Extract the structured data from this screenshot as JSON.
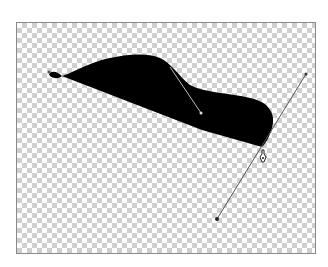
{
  "canvas": {
    "background": "transparent-checkerboard",
    "checker_colors": [
      "#ffffff",
      "#cfcfcf"
    ]
  },
  "shape": {
    "fill": "#000000",
    "anchor_points": [
      [
        49,
        74
      ],
      [
        202,
        114
      ],
      [
        262,
        147
      ]
    ]
  },
  "handles": [
    {
      "from": [
        170,
        67
      ],
      "to": [
        201,
        113
      ]
    },
    {
      "from": [
        306,
        74
      ],
      "to": [
        217,
        219
      ]
    }
  ],
  "cursor": {
    "icon": "pen-tool-icon",
    "position": [
      262,
      156
    ]
  }
}
